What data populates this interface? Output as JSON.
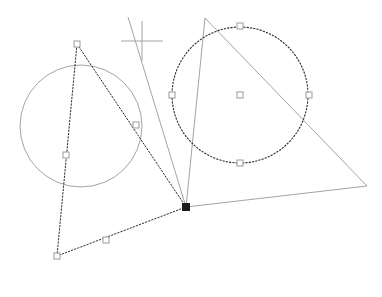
{
  "canvas": {
    "width": 382,
    "height": 297,
    "background": "#ffffff",
    "title": "Geometry Construction Canvas"
  },
  "colors": {
    "unselected_stroke": "#8c8c8c",
    "selected_stroke": "#2b2b2b",
    "handle_fill": "#ffffff",
    "handle_stroke": "#9a9a9a",
    "anchor_fill": "#1a1a1a",
    "cursor_stroke": "#9a9a9a"
  },
  "shapes": {
    "left_circle": {
      "name": "left-circle",
      "cx": 81,
      "cy": 126,
      "r": 61,
      "selected": false,
      "stroke": "#8c8c8c",
      "stroke_width": 0.8,
      "dash": "none"
    },
    "right_circle": {
      "name": "right-circle",
      "cx": 240,
      "cy": 95,
      "r": 68,
      "selected": true,
      "stroke": "#2b2b2b",
      "stroke_width": 1.1,
      "dash": "2.2 1.1",
      "handles": [
        {
          "name": "handle-north",
          "x": 240,
          "y": 26
        },
        {
          "name": "handle-east",
          "x": 309,
          "y": 95
        },
        {
          "name": "handle-south",
          "x": 240,
          "y": 163
        },
        {
          "name": "handle-west",
          "x": 172,
          "y": 95
        },
        {
          "name": "handle-center",
          "x": 240,
          "y": 95
        }
      ]
    },
    "selected_triangle": {
      "name": "selected-triangle",
      "points": "77,44 186,207 57,256",
      "selected": true,
      "stroke": "#2b2b2b",
      "stroke_width": 1.0,
      "dash": "2.2 1.1",
      "vertices": [
        {
          "name": "vertex-apex",
          "x": 77,
          "y": 44,
          "type": "open"
        },
        {
          "name": "vertex-right",
          "x": 186,
          "y": 207,
          "type": "filled"
        },
        {
          "name": "vertex-bottom-left",
          "x": 57,
          "y": 256,
          "type": "open"
        }
      ],
      "midpoints": [
        {
          "name": "midpoint-apex-right",
          "x": 136,
          "y": 125
        },
        {
          "name": "midpoint-right-bottom",
          "x": 106,
          "y": 240
        },
        {
          "name": "midpoint-bottom-apex",
          "x": 66,
          "y": 155
        }
      ]
    },
    "outline_triangle": {
      "name": "outline-triangle",
      "points": "205,18 367,186 186,207",
      "selected": false,
      "stroke": "#8c8c8c",
      "stroke_width": 0.8,
      "dash": "none"
    },
    "construction_line": {
      "name": "construction-line",
      "x1": 128,
      "y1": 17,
      "x2": 186,
      "y2": 207,
      "stroke": "#8c8c8c",
      "stroke_width": 0.8
    }
  },
  "cursor": {
    "name": "crosshair-cursor",
    "x": 142,
    "y": 41,
    "arm_h": 21,
    "arm_v": 20,
    "stroke": "#9a9a9a",
    "stroke_width": 0.9
  },
  "handle_size": 6,
  "anchor_size": 7
}
